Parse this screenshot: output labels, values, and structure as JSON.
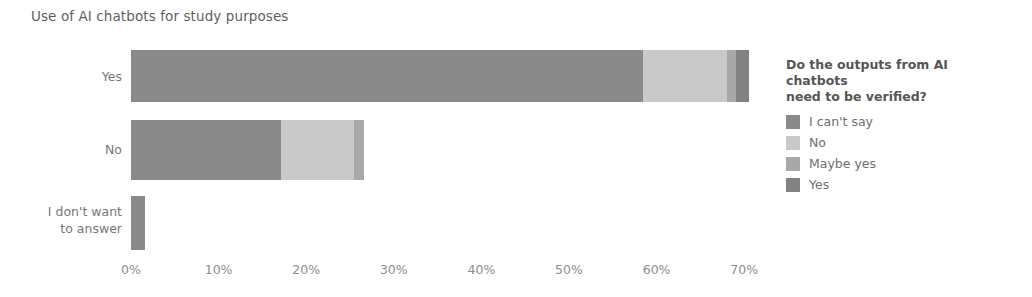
{
  "title": "Use of AI chatbots for study purposes",
  "legend": {
    "title": "Do the outputs from AI chatbots need to be verified?",
    "title_line1": "Do the outputs from AI chatbots",
    "title_line2": "need to be verified?",
    "items": [
      {
        "label": "I can't say",
        "color": "#8a8a8a"
      },
      {
        "label": "No",
        "color": "#c9c9c9"
      },
      {
        "label": "Maybe yes",
        "color": "#a8a8a8"
      },
      {
        "label": "Yes",
        "color": "#828282"
      }
    ]
  },
  "axis": {
    "ticks": [
      "0%",
      "10%",
      "20%",
      "30%",
      "40%",
      "50%",
      "60%",
      "70%"
    ],
    "tick_values": [
      0,
      10,
      20,
      30,
      40,
      50,
      60,
      70
    ],
    "min": 0,
    "max": 70,
    "origin_px": 131,
    "px_per_percent": 8.76
  },
  "categories": [
    {
      "label": "Yes",
      "label_lines": [
        "Yes"
      ]
    },
    {
      "label": "No",
      "label_lines": [
        "No"
      ]
    },
    {
      "label": "I don't want to answer",
      "label_lines": [
        "I don't want",
        "to answer"
      ]
    }
  ],
  "chart_data": {
    "type": "bar",
    "orientation": "horizontal",
    "stacked": true,
    "title": "Use of AI chatbots for study purposes",
    "xlabel": "",
    "ylabel": "",
    "xlim": [
      0,
      70
    ],
    "grid": false,
    "legend_position": "right",
    "legend_title": "Do the outputs from AI chatbots need to be verified?",
    "categories": [
      "Yes",
      "No",
      "I don't want to answer"
    ],
    "series": [
      {
        "name": "I can't say",
        "color": "#8a8a8a",
        "values": [
          58.5,
          17.1,
          1.6
        ]
      },
      {
        "name": "No",
        "color": "#c9c9c9",
        "values": [
          9.5,
          8.4,
          0.0
        ]
      },
      {
        "name": "Maybe yes",
        "color": "#a8a8a8",
        "values": [
          1.1,
          1.1,
          0.0
        ]
      },
      {
        "name": "Yes",
        "color": "#828282",
        "values": [
          1.4,
          0.0,
          0.0
        ]
      }
    ],
    "totals": [
      70.5,
      26.6,
      1.6
    ],
    "units": "percent"
  }
}
